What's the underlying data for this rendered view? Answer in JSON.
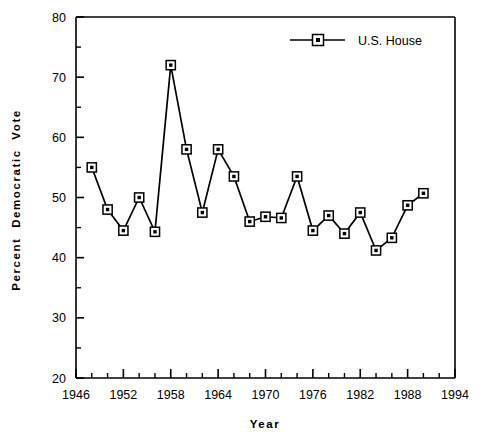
{
  "chart_data": {
    "type": "line",
    "title": "",
    "xlabel": "Year",
    "ylabel": "Percent  Democratic  Vote",
    "xlim": [
      1946,
      1994
    ],
    "ylim": [
      20,
      80
    ],
    "grid": false,
    "legend_position": "top-right",
    "x_major_ticks": [
      1946,
      1952,
      1958,
      1964,
      1970,
      1976,
      1982,
      1988,
      1994
    ],
    "x_minor_tick_interval": 2,
    "y_major_ticks": [
      20,
      30,
      40,
      50,
      60,
      70,
      80
    ],
    "y_minor_tick_interval": 5,
    "x_tick_labels": [
      "1946",
      "1952",
      "1958",
      "1964",
      "1970",
      "1976",
      "1982",
      "1988",
      "1994"
    ],
    "y_tick_labels": [
      "20",
      "30",
      "40",
      "50",
      "60",
      "70",
      "80"
    ],
    "series": [
      {
        "name": "U.S. House",
        "marker": "square",
        "color": "#000000",
        "x": [
          1948,
          1950,
          1952,
          1954,
          1956,
          1958,
          1960,
          1962,
          1964,
          1966,
          1968,
          1970,
          1972,
          1974,
          1976,
          1978,
          1980,
          1982,
          1984,
          1986,
          1988,
          1990
        ],
        "values": [
          55.0,
          48.0,
          44.5,
          50.0,
          44.3,
          72.0,
          58.0,
          47.5,
          58.0,
          53.5,
          46.0,
          46.8,
          46.6,
          53.5,
          44.5,
          47.0,
          44.0,
          47.5,
          41.2,
          43.3,
          48.7,
          50.7
        ]
      }
    ]
  },
  "legend": {
    "entries": [
      {
        "label": "U.S. House"
      }
    ]
  },
  "axes": {
    "x_axis_title": "Year",
    "y_axis_title": "Percent  Democratic  Vote"
  }
}
